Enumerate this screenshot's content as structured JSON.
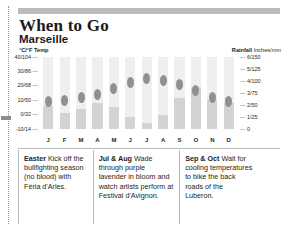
{
  "title": "When to Go",
  "subtitle": "Marseille",
  "legend": {
    "left": "°C/°F Temp",
    "right_bold": "Rainfall",
    "right_rest": " Inches/mm"
  },
  "axis": {
    "left_ticks": [
      "40/104",
      "30/86",
      "20/68",
      "10/50",
      "0/32",
      "-10/14"
    ],
    "right_ticks": [
      "6/150",
      "5/125",
      "4/100",
      "3/75",
      "2/50",
      "1/25",
      "0"
    ],
    "months": [
      "J",
      "F",
      "M",
      "A",
      "M",
      "J",
      "J",
      "A",
      "S",
      "O",
      "N",
      "D"
    ]
  },
  "notes": [
    {
      "lead": "Easter",
      "text": " Kick off the bullfighting season (no blood) with Féria d'Arles."
    },
    {
      "lead": "Jul & Aug",
      "text": " Wade through purple lavender in bloom and watch artists perform at Festival d'Avignon."
    },
    {
      "lead": "Sep & Oct",
      "text": " Wait for cooling temperatures to bike the back roads of the Luberon."
    }
  ],
  "colors": {
    "temp_marker": "#8e9091",
    "rain_bar": "#d2d3d4",
    "column": "#efefef",
    "rule": "#b9bcbe"
  },
  "chart_data": {
    "type": "bar",
    "xlabel": "",
    "ylabel": "°C/°F Temp",
    "categories": [
      "J",
      "F",
      "M",
      "A",
      "M",
      "J",
      "J",
      "A",
      "S",
      "O",
      "N",
      "D"
    ],
    "ylim": [
      -10,
      40
    ],
    "y2lim": [
      0,
      6
    ],
    "grid": true,
    "legend_position": "top",
    "series": [
      {
        "name": "Temp",
        "unit": "°C",
        "axis": "left",
        "type": "marker",
        "values": [
          9,
          10,
          12,
          14,
          18,
          22,
          25,
          24,
          21,
          17,
          12,
          9
        ]
      },
      {
        "name": "Rainfall",
        "unit": "inches",
        "axis": "right",
        "type": "bar",
        "values": [
          1.9,
          1.3,
          1.7,
          2.2,
          1.8,
          1.0,
          0.5,
          1.2,
          2.6,
          3.5,
          2.4,
          2.2
        ]
      }
    ]
  }
}
